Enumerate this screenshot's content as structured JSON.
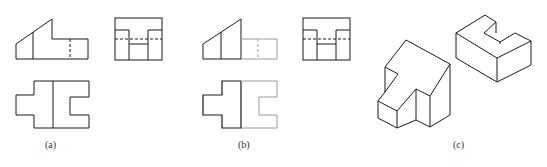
{
  "figures": [
    {
      "id": "a",
      "label": "(a)",
      "description": "Three-view orthographic drawing: front, side and top views"
    },
    {
      "id": "b",
      "label": "(b)",
      "description": "Three-view drawing with left part emphasized (right part faded)"
    },
    {
      "id": "c",
      "label": "(c)",
      "description": "Isometric drawings of the two component parts"
    }
  ],
  "colors": {
    "line": "#1a1a1a",
    "faded": "#9a9a9a",
    "background": "#ffffff"
  }
}
